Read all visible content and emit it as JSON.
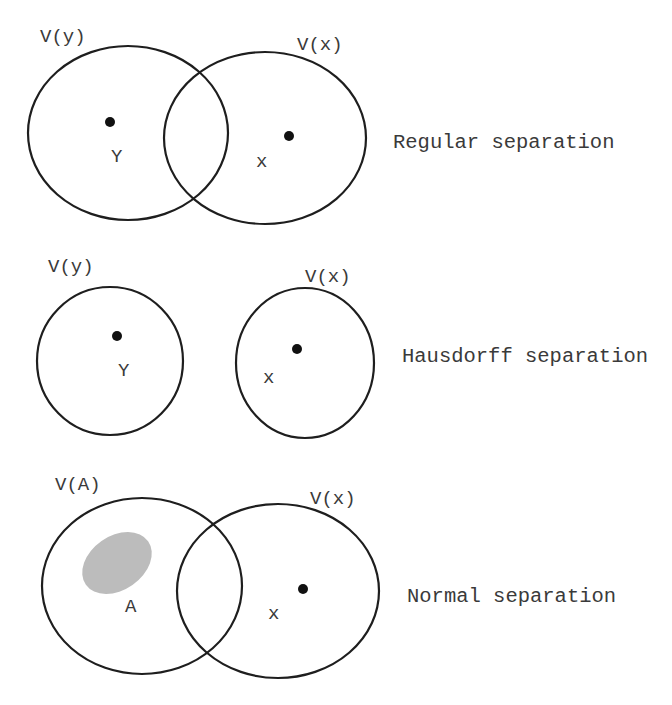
{
  "diagram": {
    "colors": {
      "outline": "#1e1e1e",
      "point": "#111111",
      "set_fill": "#bcbcbc",
      "text": "#3a3a3a",
      "background": "#ffffff"
    },
    "panels": [
      {
        "id": "regular",
        "caption": "Regular separation",
        "caption_pos": [
          393,
          148
        ],
        "neighborhoods": [
          {
            "label": "V(y)",
            "label_pos": [
              40,
              42
            ],
            "cx": 128,
            "cy": 133,
            "rx": 100,
            "ry": 87
          },
          {
            "label": "V(x)",
            "label_pos": [
              297,
              50
            ],
            "cx": 265,
            "cy": 138,
            "rx": 101,
            "ry": 86
          }
        ],
        "points": [
          {
            "name": "y",
            "label": "Y",
            "dot": [
              110,
              122
            ],
            "label_pos": [
              111,
              162
            ]
          },
          {
            "name": "x",
            "label": "x",
            "dot": [
              289,
              136
            ],
            "label_pos": [
              256,
              167
            ]
          }
        ]
      },
      {
        "id": "hausdorff",
        "caption": "Hausdorff separation",
        "caption_pos": [
          402,
          362
        ],
        "neighborhoods": [
          {
            "label": "V(y)",
            "label_pos": [
              48,
              272
            ],
            "cx": 110,
            "cy": 361,
            "rx": 73,
            "ry": 74
          },
          {
            "label": "V(x)",
            "label_pos": [
              305,
              282
            ],
            "cx": 305,
            "cy": 363,
            "rx": 69,
            "ry": 75
          }
        ],
        "points": [
          {
            "name": "y",
            "label": "Y",
            "dot": [
              117,
              336
            ],
            "label_pos": [
              118,
              376
            ]
          },
          {
            "name": "x",
            "label": "x",
            "dot": [
              297,
              349
            ],
            "label_pos": [
              263,
              383
            ]
          }
        ]
      },
      {
        "id": "normal",
        "caption": "Normal separation",
        "caption_pos": [
          407,
          602
        ],
        "neighborhoods": [
          {
            "label": "V(A)",
            "label_pos": [
              55,
              490
            ],
            "cx": 142,
            "cy": 586,
            "rx": 100,
            "ry": 88
          },
          {
            "label": "V(x)",
            "label_pos": [
              310,
              504
            ],
            "cx": 278,
            "cy": 591,
            "rx": 101,
            "ry": 87
          }
        ],
        "closed_set": {
          "name": "A",
          "label": "A",
          "cx": 117,
          "cy": 563,
          "rx": 38,
          "ry": 27,
          "rotate": -35,
          "label_pos": [
            125,
            612
          ]
        },
        "points": [
          {
            "name": "x",
            "label": "x",
            "dot": [
              303,
              589
            ],
            "label_pos": [
              268,
              619
            ]
          }
        ]
      }
    ]
  }
}
